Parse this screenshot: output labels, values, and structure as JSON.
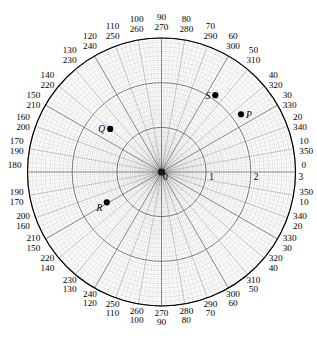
{
  "chart_data": {
    "type": "scatter",
    "projection": "polar",
    "title": "",
    "xlabel": "",
    "ylabel": "",
    "grid": true,
    "legend_position": "none",
    "center_px": [
      161.5,
      172.0
    ],
    "outer_radius_px": 134.0,
    "radial": {
      "label_values": [
        "0",
        "1",
        "2",
        "3"
      ],
      "rlim": [
        0,
        3
      ],
      "major_ticks": [
        1,
        2,
        3
      ],
      "minor_step": 0.1,
      "axis_angle_deg": 0
    },
    "angular": {
      "outer_direction": "counterclockwise",
      "inner_direction": "clockwise",
      "step_deg": 10,
      "minor_step_deg": 2,
      "labels": [
        {
          "outer": "0",
          "inner": ""
        },
        {
          "outer": "10",
          "inner": "350"
        },
        {
          "outer": "20",
          "inner": "340"
        },
        {
          "outer": "30",
          "inner": "330"
        },
        {
          "outer": "40",
          "inner": "320"
        },
        {
          "outer": "50",
          "inner": "310"
        },
        {
          "outer": "60",
          "inner": "300"
        },
        {
          "outer": "70",
          "inner": "290"
        },
        {
          "outer": "80",
          "inner": "280"
        },
        {
          "outer": "90",
          "inner": "270"
        },
        {
          "outer": "100",
          "inner": "260"
        },
        {
          "outer": "110",
          "inner": "250"
        },
        {
          "outer": "120",
          "inner": "240"
        },
        {
          "outer": "130",
          "inner": "230"
        },
        {
          "outer": "140",
          "inner": "220"
        },
        {
          "outer": "150",
          "inner": "210"
        },
        {
          "outer": "160",
          "inner": "200"
        },
        {
          "outer": "170",
          "inner": "190"
        },
        {
          "outer": "180",
          "inner": ""
        },
        {
          "outer": "190",
          "inner": "170"
        },
        {
          "outer": "200",
          "inner": "160"
        },
        {
          "outer": "210",
          "inner": "150"
        },
        {
          "outer": "220",
          "inner": "140"
        },
        {
          "outer": "230",
          "inner": "130"
        },
        {
          "outer": "240",
          "inner": "120"
        },
        {
          "outer": "250",
          "inner": "110"
        },
        {
          "outer": "260",
          "inner": "100"
        },
        {
          "outer": "270",
          "inner": "90"
        },
        {
          "outer": "280",
          "inner": "80"
        },
        {
          "outer": "290",
          "inner": "70"
        },
        {
          "outer": "300",
          "inner": "60"
        },
        {
          "outer": "310",
          "inner": "50"
        },
        {
          "outer": "320",
          "inner": "40"
        },
        {
          "outer": "330",
          "inner": "30"
        },
        {
          "outer": "340",
          "inner": "20"
        },
        {
          "outer": "350",
          "inner": "10"
        }
      ]
    },
    "points": [
      {
        "name": "P",
        "angle_deg": 36,
        "r": 2.2,
        "label_side": "right"
      },
      {
        "name": "S",
        "angle_deg": 55,
        "r": 2.1,
        "label_side": "left"
      },
      {
        "name": "Q",
        "angle_deg": 140,
        "r": 1.5,
        "label_side": "left"
      },
      {
        "name": "R",
        "angle_deg": 209,
        "r": 1.4,
        "label_side": "left-below"
      }
    ],
    "colors": {
      "point": "#000000",
      "grid_major": "#555555",
      "grid_minor": "#9a9a9a",
      "outline": "#000000",
      "background": "#ffffff"
    }
  }
}
